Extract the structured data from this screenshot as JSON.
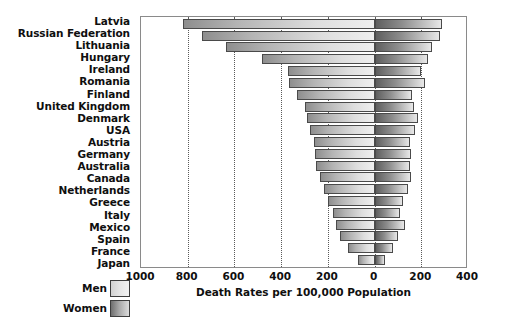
{
  "chart_data": {
    "type": "bar",
    "subtype": "diverging-horizontal-bar",
    "title": "",
    "xlabel": "Death Rates per 100,000 Population",
    "ylabel": "",
    "grid": true,
    "legend_position": "bottom-left",
    "axis_min": -1000,
    "axis_max": 400,
    "zero_at": 0,
    "tick_values": [
      1000,
      800,
      600,
      400,
      200,
      0,
      200,
      400
    ],
    "tick_labels": [
      "1000",
      "800",
      "600",
      "400",
      "200",
      "0",
      "200",
      "400"
    ],
    "tick_signed": [
      -1000,
      -800,
      -600,
      -400,
      -200,
      0,
      200,
      400
    ],
    "categories": [
      "Latvia",
      "Russian Federation",
      "Lithuania",
      "Hungary",
      "Ireland",
      "Romania",
      "Finland",
      "United Kingdom",
      "Denmark",
      "USA",
      "Austria",
      "Germany",
      "Australia",
      "Canada",
      "Netherlands",
      "Greece",
      "Italy",
      "Mexico",
      "Spain",
      "France",
      "Japan"
    ],
    "series": [
      {
        "name": "Men",
        "direction": "left",
        "color": "#dedede",
        "values": [
          820,
          740,
          635,
          480,
          370,
          365,
          330,
          300,
          290,
          275,
          260,
          255,
          250,
          235,
          215,
          200,
          180,
          165,
          150,
          115,
          70
        ]
      },
      {
        "name": "Women",
        "direction": "right",
        "color": "#8d8d8d",
        "values": [
          290,
          280,
          245,
          230,
          200,
          215,
          160,
          170,
          185,
          175,
          150,
          155,
          150,
          155,
          145,
          120,
          110,
          130,
          100,
          80,
          45
        ]
      }
    ]
  },
  "legend": {
    "items": [
      {
        "label": "Men",
        "swatch": "men-swatch"
      },
      {
        "label": "Women",
        "swatch": "women-swatch"
      }
    ]
  }
}
